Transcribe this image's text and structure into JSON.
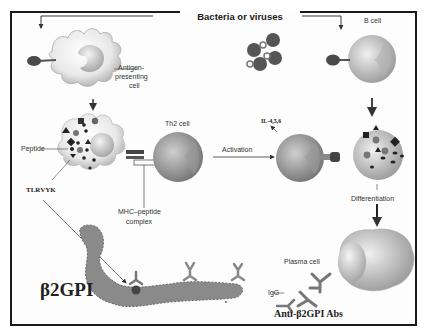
{
  "diagram": {
    "title": "Bacteria or viruses",
    "labels": {
      "apc": "Antigen-presenting cell",
      "apc_line1": "Antigen-",
      "apc_line2": "presenting",
      "apc_line3": "cell",
      "peptide": "Peptide",
      "tlrvyk": "TLRVYK",
      "th2_cell": "Th2 cell",
      "mhc_line1": "MHC–peptide",
      "mhc_line2": "complex",
      "activation": "Activation",
      "interleukins": "IL-4,5,6",
      "b_cell": "B cell",
      "differentiation": "Differentiation",
      "plasma_cell": "Plasma cell",
      "igg": "IgG",
      "beta2gpi": "β2GPI",
      "anti_beta2gpi": "Anti-β2GPI Abs"
    },
    "colors": {
      "frame": "#1a1a1a",
      "cell_fill": "#ececec",
      "nucleus": "#bdbdbd",
      "dark_shape": "#3a3a3a",
      "pathogen": "#555555",
      "protein": "#8a8a8a"
    },
    "nodes": [
      {
        "id": "pathogens",
        "label": "Bacteria or viruses"
      },
      {
        "id": "apc",
        "label": "Antigen-presenting cell"
      },
      {
        "id": "apc_processing",
        "label": "Peptide"
      },
      {
        "id": "th2",
        "label": "Th2 cell"
      },
      {
        "id": "th2_active",
        "label": "Activation"
      },
      {
        "id": "b_cell",
        "label": "B cell"
      },
      {
        "id": "b_cell_presenting",
        "label": "Differentiation"
      },
      {
        "id": "plasma",
        "label": "Plasma cell"
      },
      {
        "id": "b2gpi",
        "label": "β2GPI"
      },
      {
        "id": "antibodies",
        "label": "Anti-β2GPI Abs"
      }
    ],
    "edges": [
      {
        "from": "pathogens",
        "to": "apc"
      },
      {
        "from": "pathogens",
        "to": "b_cell"
      },
      {
        "from": "apc",
        "to": "apc_processing"
      },
      {
        "from": "apc_processing",
        "to": "th2",
        "label": "MHC–peptide complex"
      },
      {
        "from": "th2",
        "to": "th2_active",
        "label": "Activation"
      },
      {
        "from": "th2_active",
        "to": "b_cell_presenting",
        "label": "IL-4,5,6"
      },
      {
        "from": "b_cell",
        "to": "b_cell_presenting"
      },
      {
        "from": "b_cell_presenting",
        "to": "plasma",
        "label": "Differentiation"
      },
      {
        "from": "plasma",
        "to": "antibodies",
        "label": "IgG"
      },
      {
        "from": "apc_processing",
        "to": "b2gpi",
        "label": "TLRVYK"
      }
    ]
  }
}
